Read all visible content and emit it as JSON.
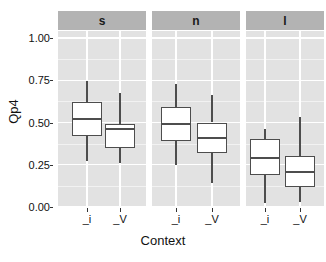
{
  "chart_data": {
    "type": "box",
    "title": "",
    "xlabel": "Context",
    "ylabel": "Qp4",
    "ylim": [
      0.0,
      1.05
    ],
    "yticks": [
      "0.00",
      "0.25",
      "0.50",
      "0.75",
      "1.00"
    ],
    "ytick_values": [
      0.0,
      0.25,
      0.5,
      0.75,
      1.0
    ],
    "grid": true,
    "legend": "none",
    "facet_variable": "",
    "facets": [
      {
        "label": "s",
        "categories": [
          "_i",
          "_V"
        ],
        "boxes": [
          {
            "category": "_i",
            "min": 0.27,
            "q1": 0.42,
            "median": 0.52,
            "q3": 0.62,
            "max": 0.745
          },
          {
            "category": "_V",
            "min": 0.26,
            "q1": 0.35,
            "median": 0.46,
            "q3": 0.49,
            "max": 0.675
          }
        ]
      },
      {
        "label": "n",
        "categories": [
          "_i",
          "_V"
        ],
        "boxes": [
          {
            "category": "_i",
            "min": 0.25,
            "q1": 0.39,
            "median": 0.49,
            "q3": 0.59,
            "max": 0.73
          },
          {
            "category": "_V",
            "min": 0.14,
            "q1": 0.32,
            "median": 0.41,
            "q3": 0.5,
            "max": 0.66
          }
        ]
      },
      {
        "label": "l",
        "categories": [
          "_i",
          "_V"
        ],
        "boxes": [
          {
            "category": "_i",
            "min": 0.025,
            "q1": 0.19,
            "median": 0.29,
            "q3": 0.4,
            "max": 0.46
          },
          {
            "category": "_V",
            "min": 0.03,
            "q1": 0.12,
            "median": 0.21,
            "q3": 0.3,
            "max": 0.53
          }
        ]
      }
    ],
    "colors": {
      "panel_background": "#e2e2e2",
      "strip_background": "#b3b3b3",
      "gridline_major": "#ffffff",
      "box_fill": "#ffffff",
      "box_line": "#4d4d4d",
      "text": "#111111"
    }
  }
}
